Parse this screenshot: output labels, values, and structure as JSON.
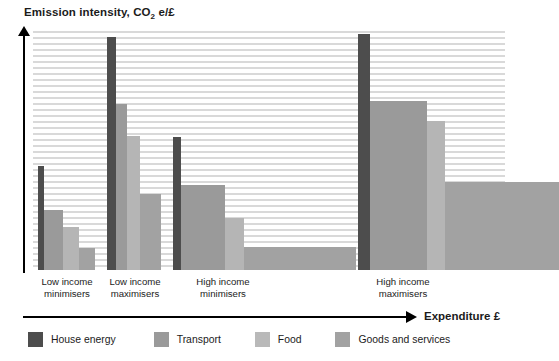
{
  "chart_data": {
    "type": "bar",
    "title": "Emission intensity, CO2 e/£",
    "ylabel": "Emission intensity, CO2 e/£",
    "xlabel": "Expenditure £",
    "grid": true,
    "legend_position": "bottom",
    "note": "Variable-width (Marimekko-style) bar chart: bar width encodes expenditure share, bar height encodes emission intensity.",
    "categories": [
      "Low income minimisers",
      "Low income maximisers",
      "High income minimisers",
      "High income maximisers"
    ],
    "series": [
      {
        "name": "House energy",
        "color": "#4d4d4d",
        "values": [
          0.62,
          1.0,
          0.57,
          1.0
        ],
        "widths": [
          0.012,
          0.018,
          0.017,
          0.022
        ]
      },
      {
        "name": "Transport",
        "color": "#9a9a9a",
        "values": [
          0.3,
          0.72,
          0.36,
          0.8
        ],
        "widths": [
          0.04,
          0.023,
          0.092,
          0.12
        ]
      },
      {
        "name": "Food",
        "color": "#b5b5b5",
        "values": [
          0.22,
          0.57,
          0.22,
          0.71
        ],
        "widths": [
          0.033,
          0.028,
          0.04,
          0.037
        ]
      },
      {
        "name": "Goods and services",
        "color": "#a2a2a2",
        "values": [
          0.1,
          0.33,
          0.09,
          0.42
        ],
        "widths": [
          0.033,
          0.045,
          0.235,
          0.24
        ]
      }
    ],
    "group_labels": [
      {
        "line1": "Low income",
        "line2": "minimisers"
      },
      {
        "line1": "Low income",
        "line2": "maximisers"
      },
      {
        "line1": "High income",
        "line2": "minimisers"
      },
      {
        "line1": "High income",
        "line2": "maximisers"
      }
    ]
  },
  "axis": {
    "y_title_main": "Emission intensity, CO",
    "y_title_sub": "2",
    "y_title_tail": " e/£",
    "x_title": "Expenditure £"
  },
  "legend": {
    "items": [
      {
        "label": "House energy",
        "color": "#4d4d4d"
      },
      {
        "label": "Transport",
        "color": "#9a9a9a"
      },
      {
        "label": "Food",
        "color": "#b9b9b9"
      },
      {
        "label": "Goods and services",
        "color": "#a2a2a2"
      }
    ]
  },
  "bars": [
    {
      "name": "low-income-minimisers-house-energy",
      "left": 5,
      "width": 6,
      "height": 104,
      "color": "#4d4d4d"
    },
    {
      "name": "low-income-minimisers-transport",
      "left": 11,
      "width": 19,
      "height": 60,
      "color": "#9a9a9a"
    },
    {
      "name": "low-income-minimisers-food",
      "left": 30,
      "width": 16,
      "height": 43,
      "color": "#b5b5b5"
    },
    {
      "name": "low-income-minimisers-goods-and-services",
      "left": 46,
      "width": 16,
      "height": 22,
      "color": "#a2a2a2"
    },
    {
      "name": "low-income-maximisers-house-energy",
      "left": 74,
      "width": 9,
      "height": 233,
      "color": "#4d4d4d"
    },
    {
      "name": "low-income-maximisers-transport",
      "left": 83,
      "width": 11,
      "height": 166,
      "color": "#9a9a9a"
    },
    {
      "name": "low-income-maximisers-food",
      "left": 94,
      "width": 13,
      "height": 134,
      "color": "#b5b5b5"
    },
    {
      "name": "low-income-maximisers-goods-and-services",
      "left": 107,
      "width": 21,
      "height": 76,
      "color": "#a2a2a2"
    },
    {
      "name": "high-income-minimisers-house-energy",
      "left": 140,
      "width": 8,
      "height": 133,
      "color": "#4d4d4d"
    },
    {
      "name": "high-income-minimisers-transport",
      "left": 148,
      "width": 44,
      "height": 85,
      "color": "#9a9a9a"
    },
    {
      "name": "high-income-minimisers-food",
      "left": 192,
      "width": 19,
      "height": 52,
      "color": "#b5b5b5"
    },
    {
      "name": "high-income-minimisers-goods-and-services",
      "left": 211,
      "width": 112,
      "height": 23,
      "color": "#a2a2a2"
    },
    {
      "name": "high-income-maximisers-house-energy",
      "left": 325,
      "width": 12,
      "height": 236,
      "color": "#4d4d4d"
    },
    {
      "name": "high-income-maximisers-transport",
      "left": 337,
      "width": 57,
      "height": 169,
      "color": "#9a9a9a"
    },
    {
      "name": "high-income-maximisers-food",
      "left": 394,
      "width": 18,
      "height": 149,
      "color": "#b5b5b5"
    },
    {
      "name": "high-income-maximisers-goods-and-services",
      "left": 412,
      "width": 114,
      "height": 88,
      "color": "#a2a2a2"
    }
  ],
  "group_label_positions": [
    {
      "left": -6,
      "line1": "Low income",
      "line2": "minimisers"
    },
    {
      "left": 62,
      "line1": "Low income",
      "line2": "maximisers"
    },
    {
      "left": 150,
      "line1": "High income",
      "line2": "minimisers"
    },
    {
      "left": 330,
      "line1": "High income",
      "line2": "maximisers"
    }
  ]
}
